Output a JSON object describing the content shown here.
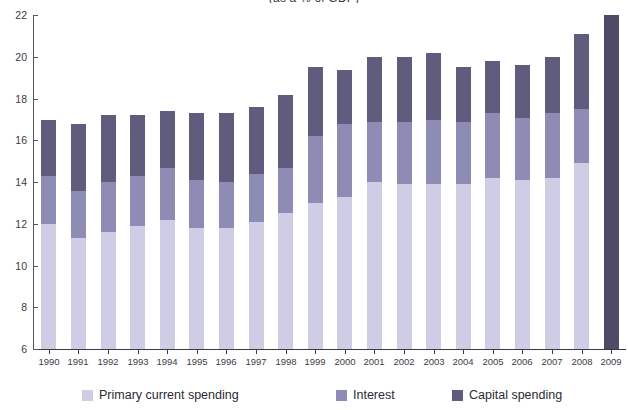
{
  "chart_data": {
    "type": "bar",
    "subtype": "stacked-column",
    "title": "(as a % of GDP)",
    "xlabel": "",
    "ylabel": "",
    "ylim": [
      6,
      22
    ],
    "ytick_step": 2,
    "yticks": [
      6,
      8,
      10,
      12,
      14,
      16,
      18,
      20,
      22
    ],
    "grid": false,
    "legend_position": "bottom",
    "categories": [
      "1990",
      "1991",
      "1992",
      "1993",
      "1994",
      "1995",
      "1996",
      "1997",
      "1998",
      "1999",
      "2000",
      "2001",
      "2002",
      "2003",
      "2004",
      "2005",
      "2006",
      "2007",
      "2008",
      "2009"
    ],
    "series": [
      {
        "name": "Primary current spending",
        "color": "#cfcde6",
        "values": [
          12.0,
          11.3,
          11.6,
          11.9,
          12.2,
          11.8,
          11.8,
          12.1,
          12.5,
          13.0,
          13.3,
          14.0,
          13.9,
          13.9,
          13.9,
          14.2,
          14.1,
          14.2,
          14.9,
          null
        ]
      },
      {
        "name": "Interest",
        "color": "#8e8cb4",
        "values": [
          2.3,
          2.3,
          2.4,
          2.4,
          2.5,
          2.3,
          2.2,
          2.3,
          2.2,
          3.2,
          3.5,
          2.9,
          3.0,
          3.1,
          3.0,
          3.1,
          3.0,
          3.1,
          2.6,
          null
        ]
      },
      {
        "name": "Capital spending",
        "color": "#5f5c7d",
        "values": [
          2.7,
          3.2,
          3.2,
          2.9,
          2.7,
          3.2,
          3.3,
          3.2,
          3.5,
          3.3,
          2.6,
          3.1,
          3.1,
          3.2,
          2.6,
          2.5,
          2.5,
          2.7,
          3.6,
          null
        ]
      },
      {
        "name": "Total (projection)",
        "color": "#4e4b68",
        "values": [
          null,
          null,
          null,
          null,
          null,
          null,
          null,
          null,
          null,
          null,
          null,
          null,
          null,
          null,
          null,
          null,
          null,
          null,
          null,
          22.0
        ]
      }
    ],
    "totals": [
      17.0,
      16.8,
      17.2,
      17.2,
      17.4,
      17.3,
      17.3,
      17.6,
      18.2,
      19.5,
      19.4,
      20.0,
      20.0,
      20.2,
      19.5,
      19.8,
      19.6,
      20.0,
      21.1,
      22.0
    ]
  },
  "axis": {
    "y_labels": [
      "22",
      "20",
      "18",
      "16",
      "14",
      "12",
      "10",
      "8",
      "6"
    ],
    "x_labels": [
      "1990",
      "1991",
      "1992",
      "1993",
      "1994",
      "1995",
      "1996",
      "1997",
      "1998",
      "1999",
      "2000",
      "2001",
      "2002",
      "2003",
      "2004",
      "2005",
      "2006",
      "2007",
      "2008",
      "2009"
    ]
  },
  "legend": {
    "primary": "Primary current spending",
    "interest": "Interest",
    "capital": "Capital spending"
  },
  "colors": {
    "primary": "#cfcde6",
    "interest": "#8e8cb4",
    "capital": "#5f5c7d",
    "projection": "#4e4b68",
    "axis": "#3a3a44"
  }
}
